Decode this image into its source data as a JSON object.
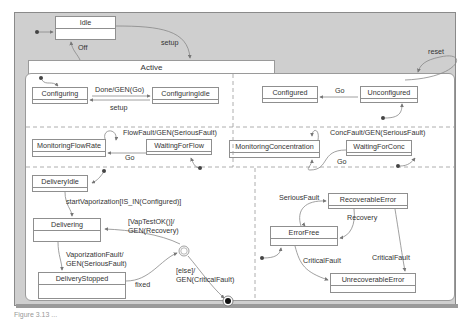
{
  "diagram": {
    "type": "statechart",
    "top_states": {
      "idle": "Idle",
      "active": "Active"
    },
    "top_transitions": {
      "setup": "setup",
      "off": "Off",
      "reset": "reset"
    },
    "regions": {
      "configuration": {
        "states": [
          "Configuring",
          "ConfiguringIdle",
          "Configured",
          "Unconfigured"
        ],
        "transitions": {
          "done": "Done/GEN(Go)",
          "setup": "setup",
          "go": "Go"
        }
      },
      "flow": {
        "states": [
          "MonitoringFlowRate",
          "WaitingForFlow"
        ],
        "transitions": {
          "fault": "FlowFault/GEN(SeriousFault)",
          "go": "Go"
        }
      },
      "concentration": {
        "states": [
          "MonitoringConcentration",
          "WaitingForConc"
        ],
        "transitions": {
          "fault": "ConcFault/GEN(SeriousFault)",
          "go": "Go"
        }
      },
      "delivery": {
        "states": [
          "DeliveryIdle",
          "Delivering",
          "DeliveryStopped"
        ],
        "transitions": {
          "start": "startVaporization[IS_IN(Configured)]",
          "vaptest_1": "[VapTestOK()]/",
          "vaptest_2": "GEN(Recovery)",
          "vapfault_1": "VaporizationFault/",
          "vapfault_2": "GEN(SeriousFault)",
          "fixed": "fixed",
          "else_1": "[else]/",
          "else_2": "GEN(CriticalFault)"
        },
        "pseudostates": {
          "condition": "C"
        }
      },
      "error": {
        "states": [
          "RecoverableError",
          "ErrorFree",
          "UnrecoverableError"
        ],
        "transitions": {
          "serious": "SeriousFault",
          "recovery": "Recovery",
          "critical_from_free": "CriticalFault",
          "critical_from_recoverable": "CriticalFault"
        }
      }
    },
    "caption": "Figure 3.13 ..."
  },
  "colors": {
    "frame_bg": "#cfcfcf",
    "state_bg": "#ffffff",
    "line": "#8f8f8f",
    "text": "#333333"
  }
}
